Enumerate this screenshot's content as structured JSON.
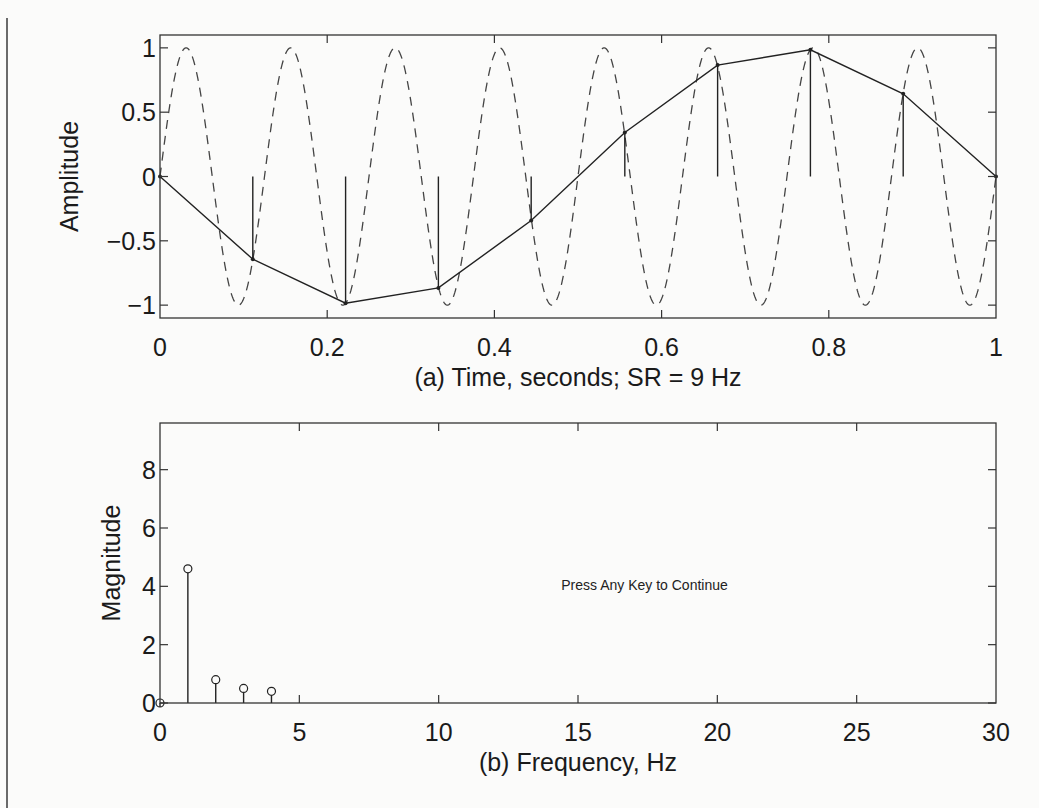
{
  "chart_data": [
    {
      "id": "a",
      "type": "line",
      "title": "",
      "xlabel": "(a)  Time, seconds; SR = 9 Hz",
      "ylabel": "Amplitude",
      "xlim": [
        0,
        1
      ],
      "ylim": [
        -1.1,
        1.1
      ],
      "xticks": [
        0,
        0.2,
        0.4,
        0.6,
        0.8,
        1
      ],
      "xtick_labels": [
        "0",
        "0.2",
        "0.4",
        "0.6",
        "0.8",
        "1"
      ],
      "yticks": [
        1,
        0.5,
        0,
        -0.5,
        -1
      ],
      "ytick_labels": [
        "1",
        "0.5",
        "0",
        "−0.5",
        "−1"
      ],
      "grid": false,
      "series": [
        {
          "name": "continuous 8 Hz sinusoid",
          "style": "dashed",
          "function": "sin(2*pi*8*t)",
          "frequency_hz": 8
        },
        {
          "name": "samples (stems + connecting line)",
          "style": "solid-stem",
          "x": [
            0,
            0.111,
            0.222,
            0.333,
            0.444,
            0.556,
            0.667,
            0.778,
            0.889,
            1.0
          ],
          "y": [
            0,
            -0.643,
            -0.985,
            -0.866,
            -0.342,
            0.342,
            0.866,
            0.985,
            0.643,
            0
          ]
        }
      ]
    },
    {
      "id": "b",
      "type": "stem",
      "title": "",
      "xlabel": "(b)  Frequency, Hz",
      "ylabel": "Magnitude",
      "xlim": [
        0,
        30
      ],
      "ylim": [
        0,
        9.6
      ],
      "xticks": [
        0,
        5,
        10,
        15,
        20,
        25,
        30
      ],
      "xtick_labels": [
        "0",
        "5",
        "10",
        "15",
        "20",
        "25",
        "30"
      ],
      "yticks": [
        0,
        2,
        4,
        6,
        8
      ],
      "ytick_labels": [
        "0",
        "2",
        "4",
        "6",
        "8"
      ],
      "grid": false,
      "series": [
        {
          "name": "magnitude spectrum",
          "marker": "circle",
          "x": [
            0,
            1,
            2,
            3,
            4
          ],
          "y": [
            0,
            4.6,
            0.8,
            0.5,
            0.4
          ]
        }
      ],
      "annotations": [
        {
          "text": "Press Any Key to Continue",
          "x": 14.4,
          "y": 4.05
        }
      ]
    }
  ]
}
